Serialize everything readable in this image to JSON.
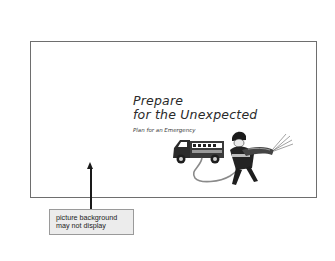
{
  "slide": {
    "title_line1": "Prepare",
    "title_line2": "for the Unexpected",
    "subtitle": "Plan for an Emergency",
    "illustration": "fire-truck-and-firefighter-with-hose"
  },
  "callout": {
    "line1": "picture background",
    "line2": "may not display",
    "arrow": "arrow-up-icon"
  },
  "colors": {
    "frame_border": "#6e6e6e",
    "text": "#2a2a2a",
    "callout_bg": "#ececec",
    "callout_border": "#9a9a9a"
  }
}
